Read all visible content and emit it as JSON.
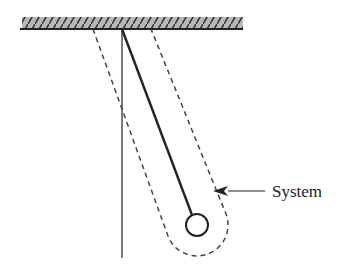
{
  "diagram": {
    "type": "pendulum-system",
    "label": "System",
    "elements": {
      "ceiling": "fixed-support-hatched",
      "rod": "pendulum-rod",
      "bob": "pendulum-bob",
      "vertical_reference": "vertical-reference-line",
      "boundary": "dashed-system-boundary",
      "arrow": "label-arrow"
    },
    "colors": {
      "stroke": "#222222",
      "ceiling_fill": "#aaaaaa",
      "dashed": "#444444"
    }
  }
}
